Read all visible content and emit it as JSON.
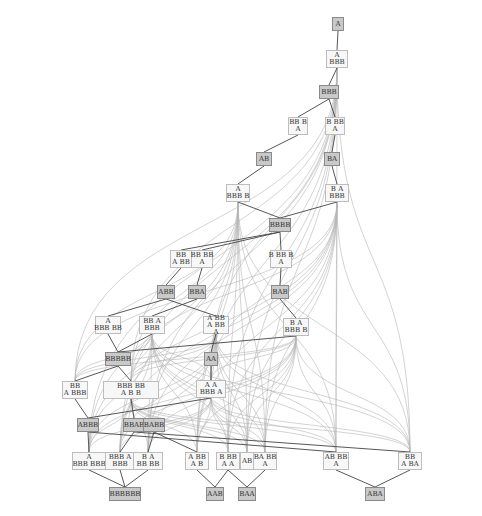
{
  "diagram": {
    "title": "",
    "colors": {
      "edge_light": "#b5b5b5",
      "edge_dark": "#444444",
      "node_fill": "#f7f7f7",
      "node_fill_highlight": "#c9c9c9",
      "node_border": "#bdbdbd",
      "node_border_highlight": "#8a8a8a"
    },
    "nodes": [
      {
        "id": "n_A",
        "label": "A",
        "x": 332,
        "y": 17,
        "w": 12,
        "h": 14,
        "hl": true
      },
      {
        "id": "n_A_BBB",
        "label": "A/BBB",
        "x": 326,
        "y": 50,
        "w": 22,
        "h": 18,
        "hl": false
      },
      {
        "id": "n_BBB",
        "label": "BBB",
        "x": 319,
        "y": 85,
        "w": 20,
        "h": 14,
        "hl": true
      },
      {
        "id": "n_BBB_A",
        "label": "BB B/A",
        "x": 288,
        "y": 117,
        "w": 20,
        "h": 18,
        "hl": false
      },
      {
        "id": "n_B_BB_A",
        "label": "B BB/A",
        "x": 325,
        "y": 117,
        "w": 20,
        "h": 18,
        "hl": false
      },
      {
        "id": "n_AB",
        "label": "AB",
        "x": 256,
        "y": 152,
        "w": 16,
        "h": 14,
        "hl": true
      },
      {
        "id": "n_BA",
        "label": "BA",
        "x": 324,
        "y": 152,
        "w": 16,
        "h": 14,
        "hl": true
      },
      {
        "id": "n_A_BBB_B",
        "label": "A/BBB B",
        "x": 226,
        "y": 184,
        "w": 24,
        "h": 18,
        "hl": false
      },
      {
        "id": "n_B_A_BBB",
        "label": "B A/BBB",
        "x": 325,
        "y": 184,
        "w": 24,
        "h": 18,
        "hl": false
      },
      {
        "id": "n_BBBB",
        "label": "BBBB",
        "x": 269,
        "y": 218,
        "w": 22,
        "h": 14,
        "hl": true
      },
      {
        "id": "n_BB_A_BB",
        "label": "BB/A BB",
        "x": 170,
        "y": 250,
        "w": 22,
        "h": 18,
        "hl": false
      },
      {
        "id": "n_BB_BB_A",
        "label": "BB BB/A",
        "x": 191,
        "y": 250,
        "w": 22,
        "h": 18,
        "hl": false
      },
      {
        "id": "n_B_BBB_A",
        "label": "B BB B/A",
        "x": 270,
        "y": 250,
        "w": 22,
        "h": 18,
        "hl": false
      },
      {
        "id": "n_ABB",
        "label": "ABB",
        "x": 157,
        "y": 285,
        "w": 18,
        "h": 14,
        "hl": true
      },
      {
        "id": "n_BBA",
        "label": "BBA",
        "x": 188,
        "y": 285,
        "w": 18,
        "h": 14,
        "hl": true
      },
      {
        "id": "n_BAB",
        "label": "BAB",
        "x": 271,
        "y": 285,
        "w": 18,
        "h": 14,
        "hl": true
      },
      {
        "id": "n_A_BBB_BB",
        "label": "A/BBB BB",
        "x": 95,
        "y": 316,
        "w": 26,
        "h": 18,
        "hl": false
      },
      {
        "id": "n_BB_A_BBB",
        "label": "BB A/BBB",
        "x": 139,
        "y": 316,
        "w": 26,
        "h": 18,
        "hl": false
      },
      {
        "id": "n_A_BB_A_BB_A",
        "label": "A BB/A BB/A",
        "x": 203,
        "y": 316,
        "w": 26,
        "h": 18,
        "hl": false
      },
      {
        "id": "n_B_A_BBB_B",
        "label": "B A/BBB B",
        "x": 283,
        "y": 318,
        "w": 26,
        "h": 18,
        "hl": false
      },
      {
        "id": "n_BBBBB",
        "label": "BBBBB",
        "x": 105,
        "y": 352,
        "w": 26,
        "h": 14,
        "hl": true
      },
      {
        "id": "n_AA",
        "label": "AA",
        "x": 204,
        "y": 352,
        "w": 14,
        "h": 14,
        "hl": true
      },
      {
        "id": "n_BB_A_BBB_2",
        "label": "BB/A BBB",
        "x": 62,
        "y": 381,
        "w": 26,
        "h": 18,
        "hl": false
      },
      {
        "id": "n_BBB_BB_A_B_B",
        "label": "BBB BB/A B B",
        "x": 103,
        "y": 381,
        "w": 56,
        "h": 18,
        "hl": false
      },
      {
        "id": "n_A_A_BBB_A",
        "label": "A A/BBB A",
        "x": 196,
        "y": 380,
        "w": 30,
        "h": 18,
        "hl": false
      },
      {
        "id": "n_ABBB",
        "label": "ABBB",
        "x": 77,
        "y": 418,
        "w": 22,
        "h": 14,
        "hl": true
      },
      {
        "id": "n_BBAB",
        "label": "BBAB",
        "x": 123,
        "y": 418,
        "w": 22,
        "h": 14,
        "hl": true
      },
      {
        "id": "n_BABB",
        "label": "BABB",
        "x": 143,
        "y": 418,
        "w": 22,
        "h": 14,
        "hl": true
      },
      {
        "id": "n_A_BBB_BBB",
        "label": "A/BBB BBB",
        "x": 72,
        "y": 452,
        "w": 34,
        "h": 18,
        "hl": false
      },
      {
        "id": "n_BBB_A_BBB",
        "label": "BBB A/BBB",
        "x": 105,
        "y": 452,
        "w": 30,
        "h": 18,
        "hl": false
      },
      {
        "id": "n_B_A_BB_BB",
        "label": "B A/BB BB",
        "x": 133,
        "y": 452,
        "w": 30,
        "h": 18,
        "hl": false
      },
      {
        "id": "n_A_BB_A_B",
        "label": "A BB/A B",
        "x": 185,
        "y": 452,
        "w": 24,
        "h": 18,
        "hl": false
      },
      {
        "id": "n_B_BB_A_A",
        "label": "B BB/A A",
        "x": 216,
        "y": 452,
        "w": 24,
        "h": 18,
        "hl": false
      },
      {
        "id": "n_AB_2",
        "label": "AB",
        "x": 240,
        "y": 452,
        "w": 14,
        "h": 18,
        "hl": false
      },
      {
        "id": "n_BA_BB_A",
        "label": "BA BB/A",
        "x": 253,
        "y": 452,
        "w": 24,
        "h": 18,
        "hl": false
      },
      {
        "id": "n_AB_BB_A",
        "label": "AB BB/A",
        "x": 323,
        "y": 452,
        "w": 26,
        "h": 18,
        "hl": false
      },
      {
        "id": "n_BB_A_BA",
        "label": "BB/A BA",
        "x": 398,
        "y": 452,
        "w": 24,
        "h": 18,
        "hl": false
      },
      {
        "id": "n_BBBBBB",
        "label": "BBBBBB",
        "x": 109,
        "y": 487,
        "w": 32,
        "h": 14,
        "hl": true
      },
      {
        "id": "n_AAB",
        "label": "AAB",
        "x": 206,
        "y": 487,
        "w": 18,
        "h": 14,
        "hl": true
      },
      {
        "id": "n_BAA",
        "label": "BAA",
        "x": 238,
        "y": 487,
        "w": 18,
        "h": 14,
        "hl": true
      },
      {
        "id": "n_ABA",
        "label": "ABA",
        "x": 365,
        "y": 487,
        "w": 20,
        "h": 14,
        "hl": true
      }
    ],
    "edges_dark": [
      [
        "n_A",
        "n_A_BBB"
      ],
      [
        "n_A_BBB",
        "n_BBB"
      ],
      [
        "n_BBB",
        "n_BBB_A"
      ],
      [
        "n_BBB",
        "n_B_BB_A"
      ],
      [
        "n_BBB_A",
        "n_AB"
      ],
      [
        "n_B_BB_A",
        "n_BA"
      ],
      [
        "n_AB",
        "n_A_BBB_B"
      ],
      [
        "n_BA",
        "n_B_A_BBB"
      ],
      [
        "n_A_BBB_B",
        "n_BBBB"
      ],
      [
        "n_B_A_BBB",
        "n_BBBB"
      ],
      [
        "n_BBBB",
        "n_BB_BB_A"
      ],
      [
        "n_BBBB",
        "n_BB_A_BB"
      ],
      [
        "n_BBBB",
        "n_B_BBB_A"
      ],
      [
        "n_BB_A_BB",
        "n_ABB"
      ],
      [
        "n_BB_BB_A",
        "n_BBA"
      ],
      [
        "n_B_BBB_A",
        "n_BAB"
      ],
      [
        "n_ABB",
        "n_A_BBB_BB"
      ],
      [
        "n_BBA",
        "n_BB_A_BBB"
      ],
      [
        "n_BAB",
        "n_B_A_BBB_B"
      ],
      [
        "n_ABB",
        "n_A_BB_A_BB_A"
      ],
      [
        "n_A_BBB_BB",
        "n_BBBBB"
      ],
      [
        "n_BB_A_BBB",
        "n_BBBBB"
      ],
      [
        "n_B_A_BBB_B",
        "n_BBBBB"
      ],
      [
        "n_A_BB_A_BB_A",
        "n_AA"
      ],
      [
        "n_BBBBB",
        "n_BB_A_BBB_2"
      ],
      [
        "n_BBBBB",
        "n_BBB_BB_A_B_B"
      ],
      [
        "n_AA",
        "n_A_A_BBB_A"
      ],
      [
        "n_BB_A_BBB_2",
        "n_ABBB"
      ],
      [
        "n_BBB_BB_A_B_B",
        "n_BBAB"
      ],
      [
        "n_A_A_BBB_A",
        "n_ABBB"
      ],
      [
        "n_ABBB",
        "n_A_BBB_BBB"
      ],
      [
        "n_BBAB",
        "n_BBB_A_BBB"
      ],
      [
        "n_BABB",
        "n_B_A_BB_BB"
      ],
      [
        "n_ABBB",
        "n_AB_BB_A"
      ],
      [
        "n_BBAB",
        "n_BB_A_BA"
      ],
      [
        "n_BABB",
        "n_A_BB_A_B"
      ],
      [
        "n_A_BBB_BBB",
        "n_BBBBBB"
      ],
      [
        "n_BBB_A_BBB",
        "n_BBBBBB"
      ],
      [
        "n_B_A_BB_BB",
        "n_BBBBBB"
      ],
      [
        "n_A_BB_A_B",
        "n_AAB"
      ],
      [
        "n_B_BB_A_A",
        "n_AAB"
      ],
      [
        "n_B_BB_A_A",
        "n_BAA"
      ],
      [
        "n_BA_BB_A",
        "n_BAA"
      ],
      [
        "n_AB_BB_A",
        "n_ABA"
      ],
      [
        "n_BB_A_BA",
        "n_ABA"
      ]
    ],
    "edges_light_fan": {
      "sources": [
        "n_A_BBB",
        "n_A_BBB_B",
        "n_B_A_BBB",
        "n_BB_A_BBB",
        "n_A_BB_A_BB_A",
        "n_B_A_BBB_B",
        "n_A_A_BBB_A",
        "n_BBB_BB_A_B_B"
      ],
      "targets": [
        "n_A_BBB_BBB",
        "n_BBB_A_BBB",
        "n_B_A_BB_BB",
        "n_A_BB_A_B",
        "n_B_BB_A_A",
        "n_AB_2",
        "n_BA_BB_A",
        "n_AB_BB_A",
        "n_BB_A_BA",
        "n_BB_A_BBB_2",
        "n_BBB_BB_A_B_B",
        "n_A_A_BBB_A"
      ]
    }
  }
}
